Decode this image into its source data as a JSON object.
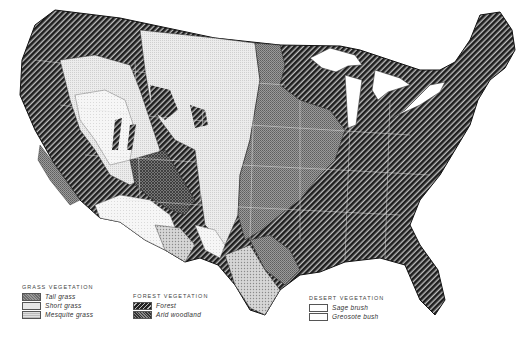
{
  "map": {
    "subject": "Natural vegetation of the United States",
    "colors": {
      "tall_grass": "#8a8a8a",
      "short_grass": "#e4e4e4",
      "mesquite_grass": "#c8c8c8",
      "forest": "#2a2a2a",
      "arid_woodland": "#5a5a5a",
      "desert": "#ffffff"
    }
  },
  "legend": {
    "grass": {
      "heading": "GRASS VEGETATION",
      "items": [
        {
          "label": "Tall grass",
          "swatch": "tall-grass"
        },
        {
          "label": "Short grass",
          "swatch": "short-grass"
        },
        {
          "label": "Mesquite grass",
          "swatch": "mesquite-grass"
        }
      ]
    },
    "forest": {
      "heading": "FOREST VEGETATION",
      "items": [
        {
          "label": "Forest",
          "swatch": "forest"
        },
        {
          "label": "Arid woodland",
          "swatch": "arid-woodland"
        }
      ]
    },
    "desert": {
      "heading": "DESERT VEGETATION",
      "items": [
        {
          "label": "Sage brush",
          "swatch": "sage-brush"
        },
        {
          "label": "Greosote bush",
          "swatch": "creosote-bush"
        }
      ]
    }
  }
}
